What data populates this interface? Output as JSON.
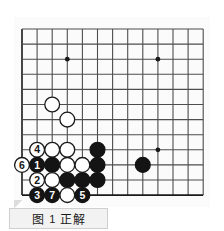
{
  "figure": {
    "caption_label": "图",
    "caption_number": "1",
    "caption_title": "正解",
    "type": "go-board-diagram"
  },
  "board": {
    "cols": 13,
    "rows": 12,
    "origin_x": 8,
    "origin_y": 12,
    "step": 15.1,
    "line_color": "#4d4d4d",
    "edge_color": "#1a1a1a",
    "background": "#fbfbfb",
    "star_points": [
      {
        "col": 3,
        "row": 2
      },
      {
        "col": 9,
        "row": 2
      },
      {
        "col": 9,
        "row": 8
      }
    ],
    "stones": [
      {
        "col": 2,
        "row": 5,
        "color": "white",
        "label": ""
      },
      {
        "col": 3,
        "row": 6,
        "color": "white",
        "label": ""
      },
      {
        "col": 1,
        "row": 8,
        "color": "white",
        "label": "4"
      },
      {
        "col": 2,
        "row": 8,
        "color": "white",
        "label": ""
      },
      {
        "col": 3,
        "row": 8,
        "color": "white",
        "label": ""
      },
      {
        "col": 5,
        "row": 8,
        "color": "black",
        "label": ""
      },
      {
        "col": 0,
        "row": 9,
        "color": "white",
        "label": "6"
      },
      {
        "col": 1,
        "row": 9,
        "color": "black",
        "label": "1"
      },
      {
        "col": 2,
        "row": 9,
        "color": "black",
        "label": ""
      },
      {
        "col": 3,
        "row": 9,
        "color": "white",
        "label": ""
      },
      {
        "col": 4,
        "row": 9,
        "color": "white",
        "label": ""
      },
      {
        "col": 5,
        "row": 9,
        "color": "black",
        "label": ""
      },
      {
        "col": 8,
        "row": 9,
        "color": "black",
        "label": ""
      },
      {
        "col": 1,
        "row": 10,
        "color": "white",
        "label": "2"
      },
      {
        "col": 2,
        "row": 10,
        "color": "white",
        "label": ""
      },
      {
        "col": 3,
        "row": 10,
        "color": "black",
        "label": ""
      },
      {
        "col": 4,
        "row": 10,
        "color": "black",
        "label": ""
      },
      {
        "col": 5,
        "row": 10,
        "color": "black",
        "label": ""
      },
      {
        "col": 1,
        "row": 11,
        "color": "black",
        "label": "3"
      },
      {
        "col": 2,
        "row": 11,
        "color": "black",
        "label": "7"
      },
      {
        "col": 3,
        "row": 11,
        "color": "white",
        "label": ""
      },
      {
        "col": 4,
        "row": 11,
        "color": "black",
        "label": "5"
      }
    ],
    "move_numbers": [
      "1",
      "2",
      "3",
      "4",
      "5",
      "6",
      "7"
    ],
    "colors": {
      "black_stone": "#141414",
      "white_stone": "#ffffff",
      "white_stone_border": "#1a1a1a",
      "black_label": "#ffffff",
      "white_label": "#141414"
    }
  }
}
